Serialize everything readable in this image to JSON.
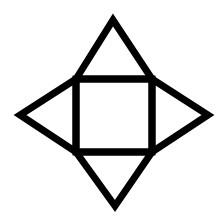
{
  "diagram": {
    "type": "pyramid-net",
    "stroke_color": "#000000",
    "background_color": "#ffffff",
    "stroke_width": 7,
    "square": {
      "x1": 76,
      "y1": 79,
      "x2": 152,
      "y2": 152
    },
    "apexes": {
      "top": {
        "x": 113,
        "y": 20
      },
      "right": {
        "x": 208,
        "y": 115
      },
      "bottom": {
        "x": 115,
        "y": 206
      },
      "left": {
        "x": 20,
        "y": 115
      }
    }
  }
}
